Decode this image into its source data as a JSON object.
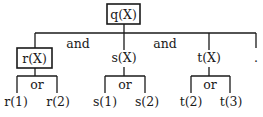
{
  "diagram": {
    "type": "and-or-tree",
    "root": {
      "label": "q(X)",
      "boxed": true
    },
    "connectives": {
      "and_1": "and",
      "and_2": "and"
    },
    "children": [
      {
        "label": "r(X)",
        "boxed": true,
        "connective": "or",
        "leaves": [
          "r(1)",
          "r(2)"
        ]
      },
      {
        "label": "s(X)",
        "boxed": false,
        "connective": "or",
        "leaves": [
          "s(1)",
          "s(2)"
        ]
      },
      {
        "label": "t(X)",
        "boxed": false,
        "connective": "or",
        "leaves": [
          "t(2)",
          "t(3)"
        ]
      },
      {
        "label": "."
      }
    ]
  }
}
